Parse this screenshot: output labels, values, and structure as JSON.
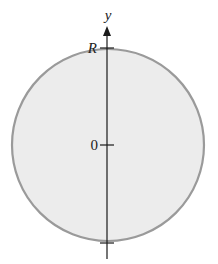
{
  "diagram": {
    "axis": {
      "label": "y",
      "ticks": [
        {
          "label": "R",
          "position": "top"
        },
        {
          "label": "0",
          "position": "center"
        },
        {
          "label": "",
          "position": "bottom"
        }
      ]
    },
    "colors": {
      "fill": "#ececec",
      "outline": "#9a9a9a",
      "axis": "#1a1a1a"
    }
  }
}
